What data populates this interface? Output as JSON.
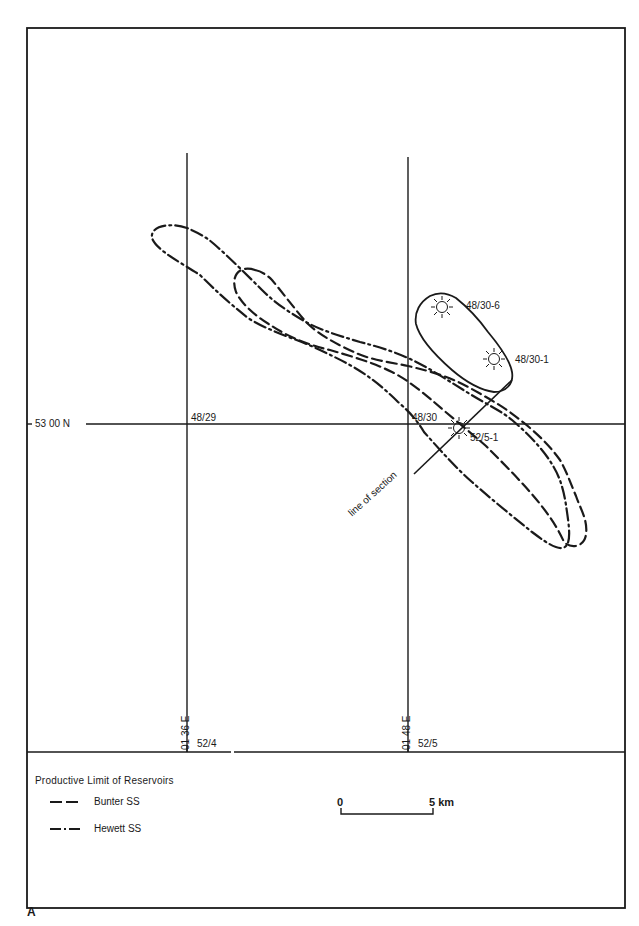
{
  "figure": {
    "letter": "A",
    "frame_color": "#1a1a1a"
  },
  "grid": {
    "latitude_label": "53 00 N",
    "longitude_labels": [
      "01 36 E",
      "01 48 E"
    ],
    "blocks": {
      "nw_left": "48/29",
      "nw_right": "48/30",
      "sw_left": "52/4",
      "sw_right": "52/5"
    }
  },
  "wells": [
    {
      "name": "48/30-6",
      "symbol": "gas-well-icon"
    },
    {
      "name": "48/30-1",
      "symbol": "gas-well-icon"
    },
    {
      "name": "52/5-1",
      "symbol": "gas-show-well-icon"
    }
  ],
  "annotations": {
    "line_of_section": "line of section"
  },
  "legend": {
    "title": "Productive Limit of Reservoirs",
    "items": [
      {
        "label": "Bunter SS",
        "style": "dashed"
      },
      {
        "label": "Hewett SS",
        "style": "dash-dot"
      }
    ]
  },
  "scale_bar": {
    "start": "0",
    "end": "5 km"
  }
}
